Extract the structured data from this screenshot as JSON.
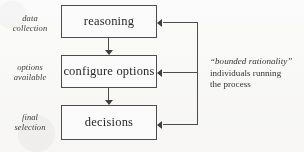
{
  "diagram": {
    "stage_labels": [
      {
        "line1": "data",
        "line2": "collection"
      },
      {
        "line1": "options",
        "line2": "available"
      },
      {
        "line1": "final",
        "line2": "selection"
      }
    ],
    "boxes": [
      {
        "label": "reasoning"
      },
      {
        "label": "configure options"
      },
      {
        "label": "decisions"
      }
    ],
    "annotation": {
      "quoted": "“bounded rationality”",
      "line2": "individuals running",
      "line3": "the process"
    },
    "colors": {
      "stroke": "#4a4a4a",
      "text": "#262626",
      "background": "#fdfdfc"
    }
  }
}
